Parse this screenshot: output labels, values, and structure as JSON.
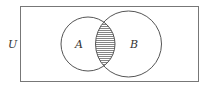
{
  "diagram": {
    "type": "venn",
    "universe_label": "U",
    "sets": [
      {
        "label": "A"
      },
      {
        "label": "B"
      }
    ],
    "shaded_region": "A ∩ B",
    "colors": {
      "stroke": "#555555",
      "hatch": "#666666",
      "background": "#ffffff"
    }
  }
}
